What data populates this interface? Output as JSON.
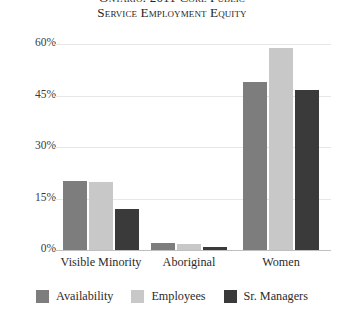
{
  "chart_data": {
    "type": "bar",
    "title": "Ontario: 2011 Core Public Service Employment Equity",
    "title_lines": [
      "Ontario: 2011 Core Public",
      "Service Employment Equity"
    ],
    "xlabel": "",
    "ylabel": "",
    "ylim": [
      0,
      60
    ],
    "grid": true,
    "legend_position": "bottom",
    "categories": [
      "Visible Minority",
      "Aboriginal",
      "Women"
    ],
    "ytick_labels": [
      "0%",
      "15%",
      "30%",
      "45%",
      "60%"
    ],
    "ytick_values": [
      0,
      15,
      30,
      45,
      60
    ],
    "series": [
      {
        "name": "Availability",
        "color": "#7d7d7d",
        "values": [
          20.0,
          2.0,
          49.0
        ]
      },
      {
        "name": "Employees",
        "color": "#c8c8c8",
        "values": [
          19.8,
          1.7,
          58.8
        ]
      },
      {
        "name": "Sr. Managers",
        "color": "#3a3a3a",
        "values": [
          12.0,
          0.8,
          46.5
        ]
      }
    ]
  },
  "axis": {
    "ticks": [
      {
        "label": "60%",
        "value": 60
      },
      {
        "label": "45%",
        "value": 45
      },
      {
        "label": "30%",
        "value": 30
      },
      {
        "label": "15%",
        "value": 15
      },
      {
        "label": "0%",
        "value": 0
      }
    ]
  },
  "categories": [
    {
      "label": "Visible Minority"
    },
    {
      "label": "Aboriginal"
    },
    {
      "label": "Women"
    }
  ],
  "legend": {
    "items": [
      {
        "label": "Availability",
        "color": "#7d7d7d"
      },
      {
        "label": "Employees",
        "color": "#c8c8c8"
      },
      {
        "label": "Sr. Managers",
        "color": "#3a3a3a"
      }
    ]
  },
  "colors": {
    "availability": "#7d7d7d",
    "employees": "#c8c8c8",
    "sr_managers": "#3a3a3a",
    "gridline": "#e7e7e7",
    "baseline": "#bfbfbf",
    "text": "#2b2b2b",
    "background": "#ffffff"
  }
}
